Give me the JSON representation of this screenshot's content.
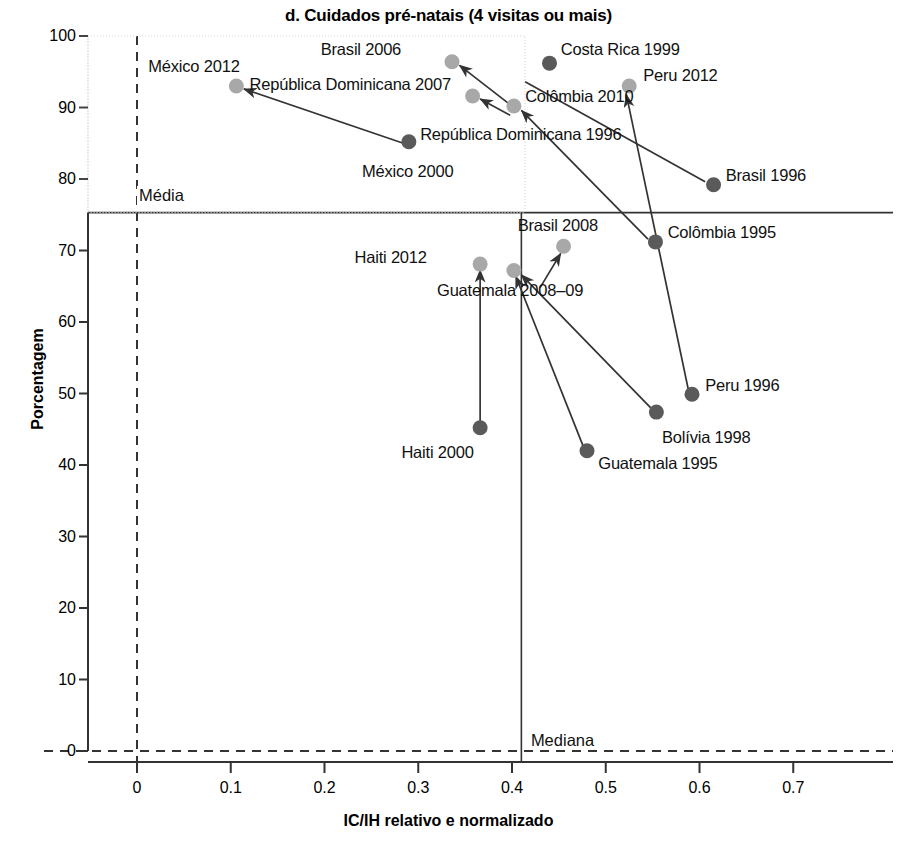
{
  "chart_data": {
    "type": "scatter",
    "title": "d. Cuidados pré-natais (4 visitas ou mais)",
    "xlabel": "IC/IH relativo e normalizado",
    "ylabel": "Porcentagem",
    "xlim": [
      -0.055,
      0.78
    ],
    "ylim": [
      -2.5,
      100
    ],
    "xticks": [
      "0",
      "0.1",
      "0.2",
      "0.3",
      "0.4",
      "0.5",
      "0.6",
      "0.7"
    ],
    "xtick_values": [
      0,
      0.1,
      0.2,
      0.3,
      0.4,
      0.5,
      0.6,
      0.7
    ],
    "yticks": [
      "0",
      "10",
      "20",
      "30",
      "40",
      "50",
      "60",
      "70",
      "80",
      "90",
      "100"
    ],
    "ytick_values": [
      0,
      10,
      20,
      30,
      40,
      50,
      60,
      70,
      80,
      90,
      100
    ],
    "grid": false,
    "legend": null,
    "reference_lines": [
      {
        "name": "media",
        "label": "Média",
        "orientation": "horizontal",
        "value": 75.3,
        "style": "solid",
        "label_x": 0.0,
        "label_y": 77.5
      },
      {
        "name": "mediana",
        "label": "Mediana",
        "orientation": "vertical",
        "value": 0.41,
        "style": "solid",
        "label_x": 0.418,
        "label_y": 1.2
      },
      {
        "name": "zero-vertical",
        "label": "",
        "orientation": "vertical",
        "value": 0.0,
        "style": "dashed"
      },
      {
        "name": "zero-horizontal",
        "label": "",
        "orientation": "horizontal",
        "value": 0.0,
        "style": "dashed"
      }
    ],
    "series": [
      {
        "name": "Países",
        "points": [
          {
            "label": "México 2012",
            "x": 0.106,
            "y": 93.0,
            "color": "#a8a8a8",
            "label_x": 0.012,
            "label_y": 95.6,
            "label_anchor": "start",
            "arrow": null
          },
          {
            "label": "Brasil 2006",
            "x": 0.336,
            "y": 96.4,
            "color": "#a8a8a8",
            "label_x": 0.196,
            "label_y": 98.0,
            "label_anchor": "start",
            "arrow": null
          },
          {
            "label": "República Dominicana 2007",
            "x": 0.358,
            "y": 91.6,
            "color": "#a8a8a8",
            "label_x": 0.12,
            "label_y": 93.2,
            "label_anchor": "start",
            "arrow": null
          },
          {
            "label": "Costa Rica 1999",
            "x": 0.44,
            "y": 96.2,
            "color": "#5a5a5a",
            "label_x": 0.452,
            "label_y": 98.0,
            "label_anchor": "start",
            "arrow": null
          },
          {
            "label": "Peru 2012",
            "x": 0.525,
            "y": 93.0,
            "color": "#a8a8a8",
            "label_x": 0.54,
            "label_y": 94.4,
            "label_anchor": "start",
            "arrow": null
          },
          {
            "label": "Colômbia 2010",
            "x": 0.402,
            "y": 90.2,
            "color": "#a8a8a8",
            "label_x": 0.414,
            "label_y": 91.5,
            "label_anchor": "start",
            "arrow": null
          },
          {
            "label": "República Dominicana 1996",
            "x": 0.29,
            "y": 85.2,
            "color": "#5a5a5a",
            "label_x": 0.302,
            "label_y": 86.2,
            "label_anchor": "start",
            "arrow": null
          },
          {
            "label": "México 2000",
            "x": 0.29,
            "y": 85.2,
            "color": "#5a5a5a",
            "label_x": 0.24,
            "label_y": 81.0,
            "label_anchor": "start",
            "arrow": null
          },
          {
            "label": "Brasil 1996",
            "x": 0.615,
            "y": 79.2,
            "color": "#5a5a5a",
            "label_x": 0.628,
            "label_y": 80.4,
            "label_anchor": "start",
            "arrow": null
          },
          {
            "label": "Colômbia 1995",
            "x": 0.553,
            "y": 71.2,
            "color": "#5a5a5a",
            "label_x": 0.566,
            "label_y": 72.4,
            "label_anchor": "start",
            "arrow": null
          },
          {
            "label": "Brasil 2008",
            "x": 0.455,
            "y": 70.6,
            "color": "#a8a8a8",
            "label_x": 0.406,
            "label_y": 73.4,
            "label_anchor": "start",
            "arrow": null
          },
          {
            "label": "Haiti 2012",
            "x": 0.366,
            "y": 68.1,
            "color": "#a8a8a8",
            "label_x": 0.232,
            "label_y": 68.9,
            "label_anchor": "start",
            "arrow": null
          },
          {
            "label": "Guatemala 2008–09",
            "x": 0.402,
            "y": 67.2,
            "color": "#a8a8a8",
            "label_x": 0.32,
            "label_y": 64.3,
            "label_anchor": "start",
            "arrow": null
          },
          {
            "label": "Peru 1996",
            "x": 0.592,
            "y": 49.9,
            "color": "#5a5a5a",
            "label_x": 0.606,
            "label_y": 51.0,
            "label_anchor": "start",
            "arrow": null
          },
          {
            "label": "Bolívia 1998",
            "x": 0.554,
            "y": 47.4,
            "color": "#5a5a5a",
            "label_x": 0.56,
            "label_y": 43.8,
            "label_anchor": "start",
            "arrow": null
          },
          {
            "label": "Haiti 2000",
            "x": 0.366,
            "y": 45.2,
            "color": "#5a5a5a",
            "label_x": 0.282,
            "label_y": 41.7,
            "label_anchor": "start",
            "arrow": null
          },
          {
            "label": "Guatemala 1995",
            "x": 0.48,
            "y": 42.0,
            "color": "#5a5a5a",
            "label_x": 0.492,
            "label_y": 40.2,
            "label_anchor": "start",
            "arrow": null
          }
        ]
      }
    ],
    "connectors": [
      {
        "name": "mexico-2000-to-mexico-2012",
        "x1": 0.284,
        "y1": 85.0,
        "x2": 0.114,
        "y2": 92.6,
        "arrow": true
      },
      {
        "name": "colombia-2010-to-brasil-2006",
        "x1": 0.398,
        "y1": 90.4,
        "x2": 0.344,
        "y2": 95.9,
        "arrow": true
      },
      {
        "name": "rep-dom-1996-to-rep-dom-2007",
        "x1": 0.398,
        "y1": 88.9,
        "x2": 0.366,
        "y2": 91.2,
        "arrow": true
      },
      {
        "name": "colombia-1995-to-colombia-2010",
        "x1": 0.545,
        "y1": 71.6,
        "x2": 0.41,
        "y2": 89.6,
        "arrow": true
      },
      {
        "name": "brasil-1996-to-brasil-2006-path",
        "x1": 0.606,
        "y1": 79.6,
        "x2": 0.414,
        "y2": 93.6,
        "arrow": false
      },
      {
        "name": "peru-1996-to-peru-2012",
        "x1": 0.588,
        "y1": 50.6,
        "x2": 0.522,
        "y2": 91.8,
        "arrow": true
      },
      {
        "name": "bolivia-1998-to-guatemala-2008-path",
        "x1": 0.548,
        "y1": 48.0,
        "x2": 0.41,
        "y2": 66.6,
        "arrow": true
      },
      {
        "name": "guatemala-1995-to-guatemala-2008",
        "x1": 0.476,
        "y1": 42.6,
        "x2": 0.404,
        "y2": 66.4,
        "arrow": true
      },
      {
        "name": "haiti-2000-to-haiti-2012",
        "x1": 0.366,
        "y1": 45.9,
        "x2": 0.366,
        "y2": 67.3,
        "arrow": true
      },
      {
        "name": "brasil-2008-to-brasil-2008-marker",
        "x1": 0.43,
        "y1": 64.8,
        "x2": 0.452,
        "y2": 69.6,
        "arrow": true
      }
    ]
  }
}
